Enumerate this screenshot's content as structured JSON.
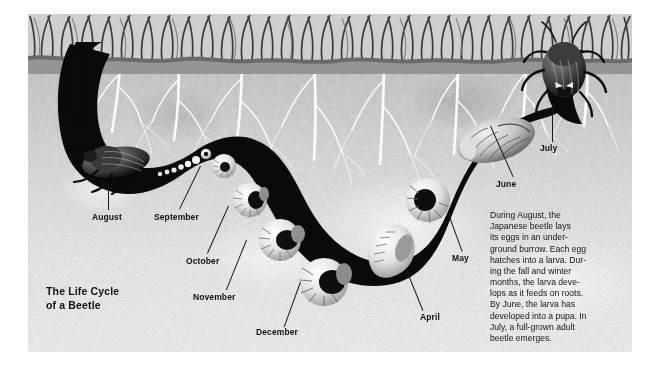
{
  "figure": {
    "title": "The Life Cycle\nof a Beetle",
    "caption": "During August, the\nJapanese beetle lays\nits eggs in an under-\nground burrow. Each egg\nhatches into a larva. Dur-\ning the fall and winter\nmonths, the larva deve-\nlops as it feeds on roots.\nBy June, the larva has\ndeveloped into a pupa. In\nJuly, a full-grown adult\nbeetle emerges.",
    "colors": {
      "ink": "#111111",
      "tunnel": "#0b0b0b",
      "soil_light": "#efefed",
      "soil_dark": "#b9b9b7",
      "root_white": "#ffffff",
      "page_background": "#ffffff"
    },
    "labels": [
      {
        "text": "August",
        "x": 78,
        "y": 198,
        "lead_x": 80,
        "lead_y": 170,
        "lead_h": 26,
        "lead_rot": 0
      },
      {
        "text": "September",
        "x": 128,
        "y": 198,
        "lead_x": 168,
        "lead_y": 152,
        "lead_h": 46,
        "lead_rot": 26
      },
      {
        "text": "October",
        "x": 158,
        "y": 242,
        "lead_x": 196,
        "lead_y": 192,
        "lead_h": 50,
        "lead_rot": 24
      },
      {
        "text": "November",
        "x": 166,
        "y": 276,
        "lead_x": 212,
        "lead_y": 226,
        "lead_h": 52,
        "lead_rot": 22
      },
      {
        "text": "December",
        "x": 228,
        "y": 311,
        "lead_x": 266,
        "lead_y": 266,
        "lead_h": 46,
        "lead_rot": 20
      },
      {
        "text": "April",
        "x": 392,
        "y": 297,
        "lead_x": 370,
        "lead_y": 256,
        "lead_h": 42,
        "lead_rot": -22
      },
      {
        "text": "May",
        "x": 424,
        "y": 238,
        "lead_x": 414,
        "lead_y": 200,
        "lead_h": 40,
        "lead_rot": -20
      },
      {
        "text": "June",
        "x": 468,
        "y": 164,
        "lead_x": 450,
        "lead_y": 112,
        "lead_h": 54,
        "lead_rot": -24
      },
      {
        "text": "July",
        "x": 500,
        "y": 128,
        "lead_x": 512,
        "lead_y": 90,
        "lead_h": 38,
        "lead_rot": 2
      }
    ],
    "stages": [
      {
        "name": "adult-beetle-august",
        "month": "August",
        "form": "adult beetle"
      },
      {
        "name": "eggs-chain",
        "month": "August",
        "form": "eggs"
      },
      {
        "name": "larva-september",
        "month": "September",
        "form": "larva"
      },
      {
        "name": "larva-october",
        "month": "October",
        "form": "larva"
      },
      {
        "name": "larva-november",
        "month": "November",
        "form": "larva"
      },
      {
        "name": "larva-december",
        "month": "December",
        "form": "larva"
      },
      {
        "name": "larva-april",
        "month": "April",
        "form": "larva"
      },
      {
        "name": "larva-may",
        "month": "May",
        "form": "larva"
      },
      {
        "name": "pupa-june",
        "month": "June",
        "form": "pupa"
      },
      {
        "name": "adult-beetle-july",
        "month": "July",
        "form": "adult beetle"
      }
    ]
  }
}
